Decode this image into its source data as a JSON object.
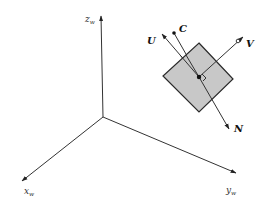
{
  "diagram": {
    "type": "3d-coordinate-frame-with-image-plane",
    "colors": {
      "background": "#ffffff",
      "stroke": "#333333",
      "plane_fill": "#c8c8c8",
      "plane_stroke": "#2a2a2a"
    },
    "world_axes": {
      "origin": [
        103,
        117
      ],
      "z": {
        "tip": [
          101,
          14
        ],
        "label": "z",
        "subscript": "w",
        "label_pos": [
          85,
          22
        ]
      },
      "x": {
        "tip": [
          20,
          183
        ],
        "label": "x",
        "subscript": "w",
        "label_pos": [
          24,
          194
        ]
      },
      "y": {
        "tip": [
          238,
          174
        ],
        "label": "y",
        "subscript": "w",
        "label_pos": [
          226,
          193
        ]
      }
    },
    "image_plane": {
      "corners": [
        [
          199,
          43
        ],
        [
          233,
          79
        ],
        [
          199,
          112
        ],
        [
          163,
          76
        ]
      ],
      "center": [
        199,
        77
      ]
    },
    "camera_frame": {
      "U": {
        "label": "U",
        "tip": [
          160,
          32
        ],
        "label_pos": [
          148,
          43
        ]
      },
      "V": {
        "label": "V",
        "tip": [
          245,
          35
        ],
        "marker": [
          238,
          41
        ],
        "label_pos": [
          246,
          47
        ]
      },
      "N": {
        "label": "N",
        "tip": [
          230,
          131
        ],
        "label_pos": [
          234,
          131
        ]
      },
      "C": {
        "label": "C",
        "point": [
          174,
          33
        ],
        "label_pos": [
          179,
          32
        ]
      }
    }
  }
}
